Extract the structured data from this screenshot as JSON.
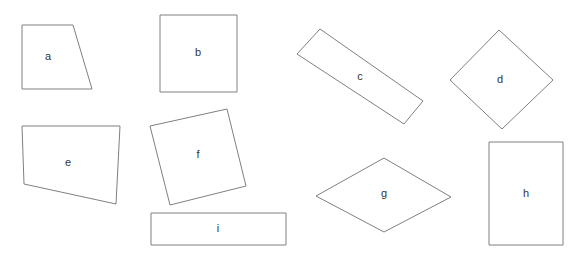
{
  "canvas": {
    "width": 575,
    "height": 258,
    "background_color": "#ffffff",
    "stroke_color": "#808080",
    "stroke_width": 1,
    "fill_color": "#ffffff",
    "label_color": "#333333",
    "label_font_size": 11
  },
  "figure": {
    "type": "geometry-shape-diagram",
    "shape_count": 9
  },
  "shapes": [
    {
      "id": "a",
      "label": "a",
      "kind": "trapezoid",
      "points": "22,25 73,25 92,89 22,89",
      "label_x": 48,
      "label_y": 57
    },
    {
      "id": "b",
      "label": "b",
      "kind": "square",
      "points": "160,15 237,15 237,92 160,92",
      "label_x": 198,
      "label_y": 53
    },
    {
      "id": "c",
      "label": "c",
      "kind": "rotated-rectangle",
      "points": "320,29 423,101 404,124 297,54",
      "label_x": 360,
      "label_y": 77
    },
    {
      "id": "d",
      "label": "d",
      "kind": "diamond",
      "points": "499,30 553,80 502,129 450,80",
      "label_x": 500,
      "label_y": 80
    },
    {
      "id": "e",
      "label": "e",
      "kind": "quadrilateral",
      "points": "22,126 120,126 116,204 24,184",
      "label_x": 68,
      "label_y": 163
    },
    {
      "id": "f",
      "label": "f",
      "kind": "tilted-square",
      "points": "227,109 246,186 170,205 150,126",
      "label_x": 198,
      "label_y": 155
    },
    {
      "id": "g",
      "label": "g",
      "kind": "rhombus",
      "points": "384,158 451,197 384,232 316,196",
      "label_x": 384,
      "label_y": 194
    },
    {
      "id": "h",
      "label": "h",
      "kind": "vertical-rectangle",
      "points": "489,142 563,142 563,245 489,245",
      "label_x": 526,
      "label_y": 194
    },
    {
      "id": "i",
      "label": "i",
      "kind": "wide-flat-rectangle",
      "points": "151,213 286,213 286,245 151,245",
      "label_x": 218,
      "label_y": 229
    }
  ]
}
